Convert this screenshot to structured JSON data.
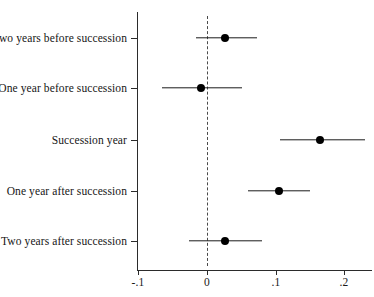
{
  "chart_data": {
    "type": "scatter",
    "subtype": "coefficient-forest-plot",
    "title": "",
    "xlabel": "",
    "ylabel": "",
    "xlim": [
      -0.13,
      0.215
    ],
    "xticks": [
      -0.1,
      0,
      0.1,
      0.2
    ],
    "xticklabels": [
      "-.1",
      "0",
      ".1",
      ".2"
    ],
    "grid": false,
    "legend": null,
    "reference_line": {
      "value": 0,
      "style": "dashed",
      "color": "#4a4a4a"
    },
    "categories": [
      "Two years before succession",
      "One year before succession",
      "Succession year",
      "One year after succession",
      "Two years after succession"
    ],
    "values": [
      0.025,
      -0.01,
      0.165,
      0.105,
      0.025
    ],
    "ci_low": [
      -0.017,
      -0.067,
      0.106,
      0.059,
      -0.028
    ],
    "ci_high": [
      0.072,
      0.05,
      0.23,
      0.15,
      0.079
    ],
    "points": [
      {
        "label": "Two years before succession",
        "estimate": 0.025,
        "ci_low": -0.017,
        "ci_high": 0.072
      },
      {
        "label": "One year before succession",
        "estimate": -0.01,
        "ci_low": -0.067,
        "ci_high": 0.05
      },
      {
        "label": "Succession year",
        "estimate": 0.165,
        "ci_low": 0.106,
        "ci_high": 0.23
      },
      {
        "label": "One year after succession",
        "estimate": 0.105,
        "ci_low": 0.059,
        "ci_high": 0.15
      },
      {
        "label": "Two years after succession",
        "estimate": 0.025,
        "ci_low": -0.028,
        "ci_high": 0.079
      }
    ],
    "colors": {
      "marker": "#000000",
      "ci_line": "#1a1a1a",
      "axis": "#2b2b2b",
      "reference": "#4a4a4a",
      "background": "#ffffff"
    }
  },
  "axis": {
    "x_tick_labels": [
      "-.1",
      "0",
      ".1",
      ".2"
    ],
    "y_tick_labels": [
      "Two years before succession",
      "One year before succession",
      "Succession year",
      "One year after succession",
      "Two years after succession"
    ]
  }
}
